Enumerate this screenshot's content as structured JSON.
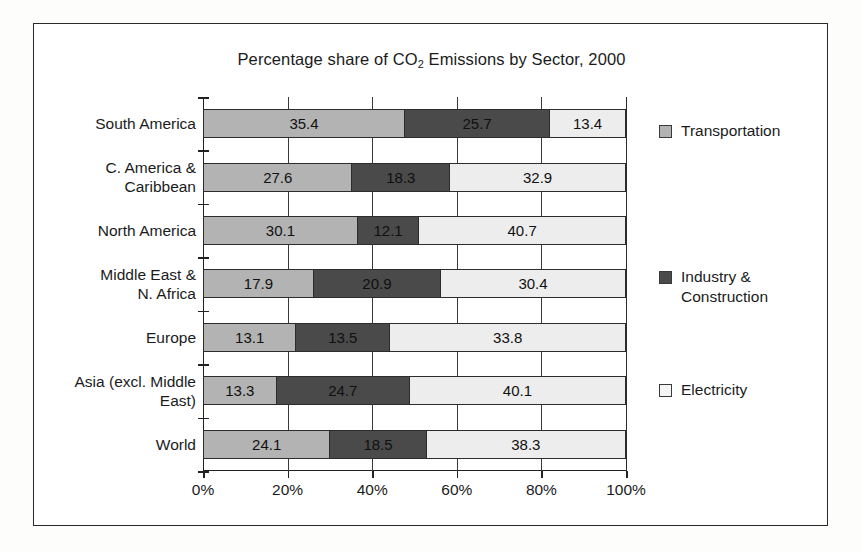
{
  "figure": {
    "title_prefix": "Percentage share of CO",
    "title_sub": "2",
    "title_suffix": " Emissions by Sector, 2000"
  },
  "chart_data": {
    "type": "bar",
    "orientation": "horizontal",
    "stacked": true,
    "stack_mode": "100% normalized",
    "title": "Percentage share of CO2 Emissions by Sector, 2000",
    "xlabel": "",
    "ylabel": "",
    "xlim": [
      0,
      100
    ],
    "xticks": [
      0,
      20,
      40,
      60,
      80,
      100
    ],
    "xticklabels": [
      "0%",
      "20%",
      "40%",
      "60%",
      "80%",
      "100%"
    ],
    "grid": true,
    "legend_position": "right",
    "categories": [
      "South America",
      "C. America & Caribbean",
      "North America",
      "Middle East & N. Africa",
      "Europe",
      "Asia (excl. Middle East)",
      "World"
    ],
    "category_lines": [
      [
        "South America"
      ],
      [
        "C. America &",
        "Caribbean"
      ],
      [
        "North America"
      ],
      [
        "Middle East &",
        "N. Africa"
      ],
      [
        "Europe"
      ],
      [
        "Asia (excl. Middle",
        "East)"
      ],
      [
        "World"
      ]
    ],
    "series": [
      {
        "name": "Transportation",
        "color": "#b3b3b3",
        "values": [
          35.4,
          27.6,
          30.1,
          17.9,
          13.1,
          13.3,
          24.1
        ]
      },
      {
        "name": "Industry & Construction",
        "color": "#4a4a4a",
        "values": [
          25.7,
          18.3,
          12.1,
          20.9,
          13.5,
          24.7,
          18.5
        ]
      },
      {
        "name": "Electricity",
        "color": "#ededed",
        "values": [
          13.4,
          32.9,
          40.7,
          30.4,
          33.8,
          40.1,
          38.3
        ]
      }
    ]
  },
  "legend": {
    "items": [
      {
        "label": "Transportation",
        "key": "transportation"
      },
      {
        "label": "Industry & Construction",
        "key": "industry"
      },
      {
        "label": "Electricity",
        "key": "electricity"
      }
    ]
  }
}
